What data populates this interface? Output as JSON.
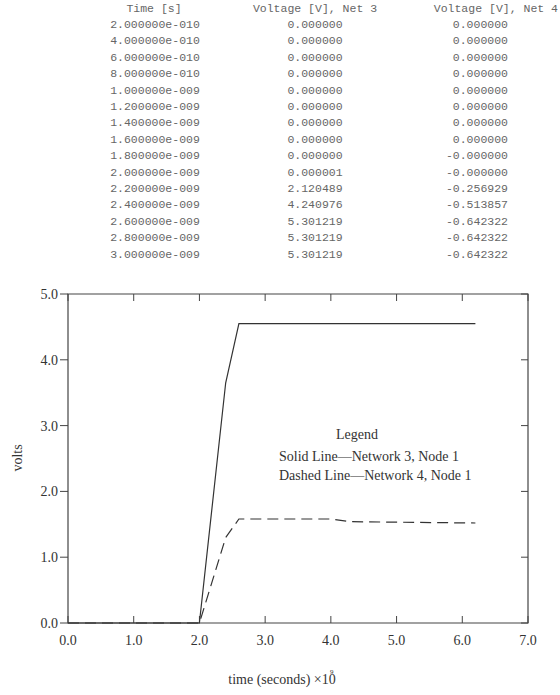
{
  "table": {
    "headers": [
      "Time [s]",
      "Voltage [V], Net 3",
      "Voltage [V], Net 4"
    ],
    "rows": [
      [
        "2.000000e-010",
        "0.000000",
        "0.000000"
      ],
      [
        "4.000000e-010",
        "0.000000",
        "0.000000"
      ],
      [
        "6.000000e-010",
        "0.000000",
        "0.000000"
      ],
      [
        "8.000000e-010",
        "0.000000",
        "0.000000"
      ],
      [
        "1.000000e-009",
        "0.000000",
        "0.000000"
      ],
      [
        "1.200000e-009",
        "0.000000",
        "0.000000"
      ],
      [
        "1.400000e-009",
        "0.000000",
        "0.000000"
      ],
      [
        "1.600000e-009",
        "0.000000",
        "0.000000"
      ],
      [
        "1.800000e-009",
        "0.000000",
        "-0.000000"
      ],
      [
        "2.000000e-009",
        "0.000001",
        "-0.000000"
      ],
      [
        "2.200000e-009",
        "2.120489",
        "-0.256929"
      ],
      [
        "2.400000e-009",
        "4.240976",
        "-0.513857"
      ],
      [
        "2.600000e-009",
        "5.301219",
        "-0.642322"
      ],
      [
        "2.800000e-009",
        "5.301219",
        "-0.642322"
      ],
      [
        "3.000000e-009",
        "5.301219",
        "-0.642322"
      ]
    ]
  },
  "chart_data": {
    "type": "line",
    "title": "",
    "xlabel": "time (seconds) ×10",
    "xlabel_exponent": "9",
    "ylabel": "volts",
    "xlim": [
      0.0,
      7.0
    ],
    "ylim": [
      0.0,
      5.0
    ],
    "xticks": [
      "0.0",
      "1.0",
      "2.0",
      "3.0",
      "4.0",
      "5.0",
      "6.0",
      "7.0"
    ],
    "yticks": [
      "0.0",
      "1.0",
      "2.0",
      "3.0",
      "4.0",
      "5.0"
    ],
    "grid": false,
    "legend": {
      "title": "Legend",
      "entries": [
        "Solid Line—Network 3, Node 1",
        "Dashed Line—Network 4, Node 1"
      ],
      "position": "center-right"
    },
    "series": [
      {
        "name": "Solid Line—Network 3, Node 1",
        "style": "solid",
        "x": [
          0.0,
          2.0,
          2.4,
          2.6,
          6.2
        ],
        "y": [
          0.0,
          0.0,
          3.65,
          4.55,
          4.55
        ]
      },
      {
        "name": "Dashed Line—Network 4, Node 1",
        "style": "dashed",
        "x": [
          0.0,
          2.0,
          2.4,
          2.6,
          4.0,
          4.3,
          6.2
        ],
        "y": [
          0.0,
          0.0,
          1.3,
          1.58,
          1.58,
          1.54,
          1.52
        ]
      }
    ]
  }
}
